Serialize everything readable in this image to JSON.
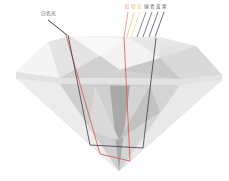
{
  "diagram": {
    "labels": {
      "white_light": "白色光",
      "spectrum": [
        "红",
        "橙",
        "黄",
        "绿",
        "青",
        "蓝",
        "紫"
      ]
    },
    "colors": {
      "spectrum": [
        "#e8796a",
        "#f0b27a",
        "#f2dc8a",
        "#5a5a5a",
        "#4a4a5a",
        "#3d3d55",
        "#3a3040"
      ],
      "white_ray": "#222222",
      "red_path": "#d8553c",
      "violet_path": "#3e3a4e",
      "diamond_light": "#f4f4f4",
      "diamond_mid": "#d2d2d2",
      "diamond_dark": "#b4b4b4"
    }
  }
}
